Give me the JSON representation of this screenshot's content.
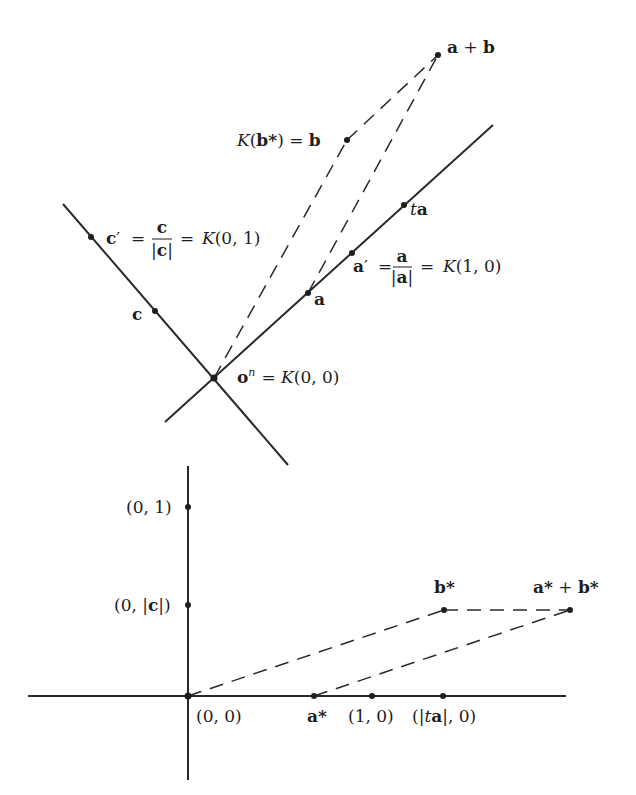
{
  "figure": {
    "upper_panel": {
      "description": "Geometric vectors in a plane with origin o^n",
      "lines": {
        "line_a": {
          "from": [
            165,
            422
          ],
          "to": [
            493,
            125
          ]
        },
        "line_c": {
          "from": [
            63,
            204
          ],
          "to": [
            288,
            465
          ]
        }
      },
      "points": [
        {
          "id": "origin",
          "label_parts": [
            "o",
            "n",
            " = ",
            "K",
            "(0, 0)"
          ],
          "x": 214,
          "y": 378
        },
        {
          "id": "a",
          "label": "a",
          "x": 308,
          "y": 293
        },
        {
          "id": "a_prime",
          "label_lhs": "a′ = ",
          "frac_num": "a",
          "frac_den": "|a|",
          "label_rhs": " = K(1, 0)",
          "x": 352,
          "y": 253
        },
        {
          "id": "ta",
          "label_t": "t",
          "label_a": "a",
          "x": 404,
          "y": 205
        },
        {
          "id": "c",
          "label": "c",
          "x": 155,
          "y": 311
        },
        {
          "id": "c_prime",
          "label_lhs": "c′ = ",
          "frac_num": "c",
          "frac_den": "|c|",
          "label_rhs": " = K(0, 1)",
          "x": 91,
          "y": 237
        },
        {
          "id": "b",
          "label": "K(b*) = b",
          "x": 347,
          "y": 140
        },
        {
          "id": "a_plus_b",
          "label": "a + b",
          "x": 438,
          "y": 55
        }
      ],
      "labels": {
        "origin_o": "o",
        "origin_sup": "n",
        "origin_eq": "= ",
        "origin_K": "K",
        "origin_coords": "(0, 0)",
        "a": "a",
        "a_prime_lhs": "a",
        "a_prime_mark": "′",
        "eq": "=",
        "a_num": "a",
        "a_den": "|a|",
        "a_prime_K": "K",
        "a_prime_coords": "(1, 0)",
        "ta_t": "t",
        "ta_a": "a",
        "c": "c",
        "c_prime_lhs": "c",
        "c_prime_mark": "′",
        "c_num": "c",
        "c_den": "|c|",
        "c_prime_K": "K",
        "c_prime_coords": "(0, 1)",
        "b_K": "K",
        "b_open": "(",
        "b_star": "b*",
        "b_close": ")",
        "b_eq": " = ",
        "b_b": "b",
        "apb_a": "a",
        "apb_plus": " + ",
        "apb_b": "b"
      }
    },
    "lower_panel": {
      "description": "Coordinate plane with origin (0,0)",
      "axes": {
        "horizontal": {
          "from": [
            28,
            696
          ],
          "to": [
            566,
            696
          ]
        },
        "vertical": {
          "from": [
            188,
            466
          ],
          "to": [
            188,
            780
          ]
        }
      },
      "points": [
        {
          "id": "origin",
          "label": "(0, 0)",
          "x": 188,
          "y": 696
        },
        {
          "id": "a_star",
          "label": "a*",
          "x": 314,
          "y": 696
        },
        {
          "id": "one_zero",
          "label": "(1, 0)",
          "x": 372,
          "y": 696
        },
        {
          "id": "ta_zero",
          "label": "(|ta|, 0)",
          "x": 443,
          "y": 696
        },
        {
          "id": "zero_one",
          "label": "(0, 1)",
          "x": 188,
          "y": 507
        },
        {
          "id": "zero_c",
          "label": "(0, |c|)",
          "x": 188,
          "y": 605
        },
        {
          "id": "b_star",
          "label": "b*",
          "x": 444,
          "y": 610
        },
        {
          "id": "a_star_plus_b_star",
          "label": "a* + b*",
          "x": 570,
          "y": 610
        }
      ],
      "labels": {
        "origin": "(0, 0)",
        "a_star": "a*",
        "one_zero": "(1, 0)",
        "ta_open": "(|",
        "ta_t": "t",
        "ta_a": "a",
        "ta_close": "|, 0)",
        "zero_one": "(0, 1)",
        "zero_c_open": "(0, |",
        "zero_c_c": "c",
        "zero_c_close": "|)",
        "b_star": "b*",
        "sum_a": "a*",
        "sum_plus": " + ",
        "sum_b": "b*"
      }
    }
  }
}
